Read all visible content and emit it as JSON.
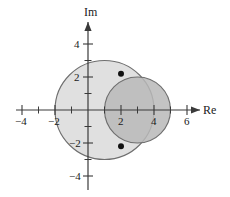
{
  "figure": {
    "title": "",
    "background": "#ffffff",
    "axis_color": "#3a3a3a"
  },
  "axes": {
    "real_axis_label": "Re",
    "imag_axis_label": "Im",
    "origin_px": {
      "x": 88,
      "y": 110
    },
    "unit_px": 16.5,
    "x_ticks": [
      {
        "value": -4,
        "label": "−4"
      },
      {
        "value": -2,
        "label": "−2"
      },
      {
        "value": 2,
        "label": "2"
      },
      {
        "value": 4,
        "label": "4"
      },
      {
        "value": 6,
        "label": "6"
      }
    ],
    "x_minor_ticks": [
      -5,
      -3,
      -1,
      1,
      3,
      5
    ],
    "y_ticks": [
      {
        "value": 4,
        "label": "4"
      },
      {
        "value": 2,
        "label": "2"
      },
      {
        "value": -2,
        "label": "−2"
      },
      {
        "value": -4,
        "label": "−4"
      }
    ],
    "y_minor_ticks": [
      3,
      1,
      -1,
      -3
    ],
    "xlim": [
      -5.6,
      7.2
    ],
    "ylim": [
      -5.3,
      5.6
    ],
    "grid": false,
    "arrow_heads": [
      "Re",
      "Im"
    ]
  },
  "chart_data": {
    "type": "scatter",
    "title": "",
    "xlabel": "Re",
    "ylabel": "Im",
    "xlim": [
      -5.6,
      7.2
    ],
    "ylim": [
      -5.3,
      5.6
    ],
    "grid": false,
    "legend": "none",
    "shapes": [
      {
        "name": "large-disk",
        "type": "circle",
        "center": [
          1,
          0
        ],
        "radius": 3,
        "fill": "#e0e0e0",
        "fill_opacity": 1,
        "stroke": "#6e6e6e",
        "stroke_width": 1
      },
      {
        "name": "small-disk",
        "type": "circle",
        "center": [
          3,
          0
        ],
        "radius": 2,
        "fill": "#b8b8b8",
        "fill_opacity": 0.85,
        "stroke": "#6e6e6e",
        "stroke_width": 1
      }
    ],
    "points": [
      {
        "name": "upper-intersection-point",
        "x": 2,
        "y": 2.2
      },
      {
        "name": "lower-intersection-point",
        "x": 2,
        "y": -2.2
      }
    ],
    "point_color": "#111111",
    "point_radius_px": 3
  }
}
